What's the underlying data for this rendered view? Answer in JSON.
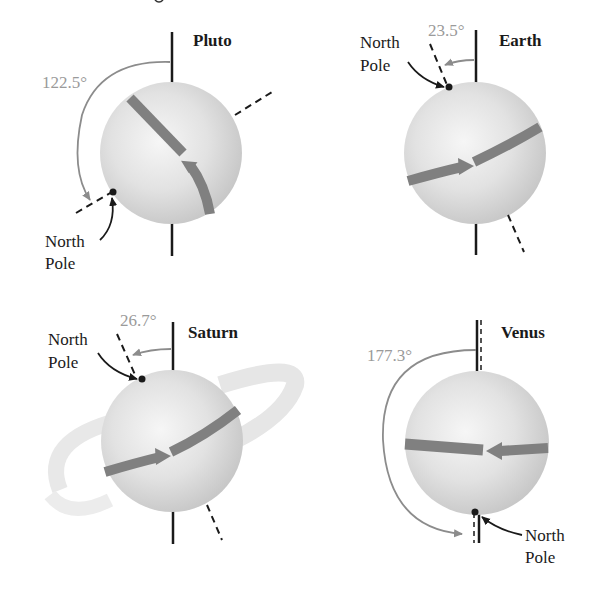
{
  "figure": {
    "caption_partial": "… rotation of planets …",
    "colors": {
      "axis": "#1a1a1a",
      "angle_arc": "#8c8c8c",
      "rotation_arrow": "#808080",
      "sphere_light": "#f4f4f4",
      "sphere_dark": "#c4c4c4",
      "ring": "#e8e8e8"
    },
    "panels": [
      {
        "planet": "Pluto",
        "tilt": "122.5°",
        "pole_label_line1": "North",
        "pole_label_line2": "Pole",
        "rotation": "retrograde-appearing, axis tipped past horizontal"
      },
      {
        "planet": "Earth",
        "tilt": "23.5°",
        "pole_label_line1": "North",
        "pole_label_line2": "Pole",
        "rotation": "prograde"
      },
      {
        "planet": "Saturn",
        "tilt": "26.7°",
        "pole_label_line1": "North",
        "pole_label_line2": "Pole",
        "rotation": "prograde",
        "has_rings": true
      },
      {
        "planet": "Venus",
        "tilt": "177.3°",
        "pole_label_line1": "North",
        "pole_label_line2": "Pole",
        "rotation": "retrograde"
      }
    ]
  }
}
